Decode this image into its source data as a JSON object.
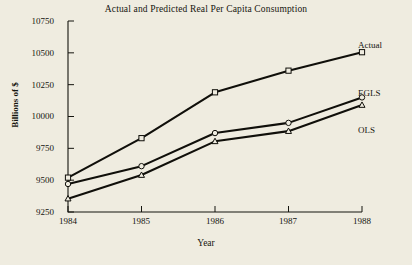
{
  "figure": {
    "background_color": "#efece0",
    "ink_color": "#15150f"
  },
  "chart_data": {
    "type": "line",
    "title": "Actual and Predicted Real Per Capita Consumption",
    "xlabel": "Year",
    "ylabel": "Billions of $",
    "x": [
      1984,
      1985,
      1986,
      1987,
      1988
    ],
    "xtick_labels": [
      "1984",
      "1985",
      "1986",
      "1987",
      "1988"
    ],
    "ytick_labels": [
      "9250",
      "9500",
      "9750",
      "10000",
      "10250",
      "10500",
      "10750"
    ],
    "yticks": [
      9250,
      9500,
      9750,
      10000,
      10250,
      10500,
      10750
    ],
    "xlim": [
      1984,
      1988
    ],
    "ylim": [
      9250,
      10750
    ],
    "grid": false,
    "legend_position": "inline-right-end-of-line",
    "series": [
      {
        "name": "Actual",
        "marker": "square",
        "values": [
          9520,
          9830,
          10190,
          10360,
          10505
        ]
      },
      {
        "name": "EGLS",
        "marker": "circle",
        "values": [
          9470,
          9610,
          9870,
          9950,
          10150
        ]
      },
      {
        "name": "OLS",
        "marker": "triangle",
        "values": [
          9355,
          9540,
          9805,
          9885,
          10090
        ]
      }
    ]
  }
}
